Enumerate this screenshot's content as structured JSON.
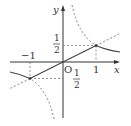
{
  "figure": {
    "type": "function-graph",
    "axes": {
      "x_label": "x",
      "y_label": "y",
      "origin_label": "O"
    },
    "tick_labels": {
      "x_neg_one": "−1",
      "x_pos_one": "1",
      "y_half_num": "1",
      "y_half_den": "2",
      "y_neg_half_num": "1",
      "y_neg_half_den": "2"
    },
    "curves": [
      {
        "name": "line",
        "equation": "y = x/2",
        "solid_range": [
          -1,
          1
        ],
        "dashed_outside": true
      },
      {
        "name": "hyperbola",
        "equation": "y = 1/(2x)",
        "solid_range": "|x| >= 1",
        "dashed_range": "0 < |x| < 1"
      }
    ],
    "points": [
      {
        "x": 1,
        "y": 0.5
      },
      {
        "x": -1,
        "y": -0.5
      }
    ],
    "colors": {
      "axis": "#333333",
      "curve": "#444444",
      "dashed": "#777777"
    }
  }
}
